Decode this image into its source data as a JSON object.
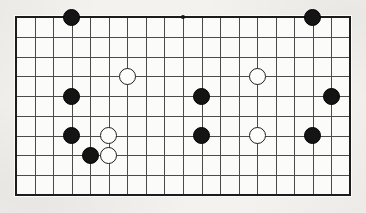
{
  "app": {
    "title": "Go Board Position",
    "caption": "Cropped view of a Go board showing a 19-column by 10-row section with black and white stones placed on line intersections."
  },
  "board": {
    "label": "go-board",
    "columns": 19,
    "rows": 10,
    "origin_x": 16,
    "origin_y": 17,
    "col_spacing": 18.55,
    "row_spacing": 19.78,
    "stone_diameter": 17,
    "hoshi_diameter": 4,
    "colors": {
      "board_surface": "#fbfbf9",
      "grid_line": "#4b4b4b",
      "edge_line": "#1c1c1c",
      "black_stone": "#141414",
      "white_stone": "#fdfdfc",
      "white_stone_outline": "#1e1e1e",
      "page_background": "#f3f2ef"
    },
    "star_points": [
      {
        "name": "hoshi-top",
        "col": 9,
        "row": 0
      }
    ],
    "stones": [
      {
        "name": "stone-black-c3-r0",
        "color": "black",
        "col": 3,
        "row": 0
      },
      {
        "name": "stone-black-c16-r0",
        "color": "black",
        "col": 16,
        "row": 0
      },
      {
        "name": "stone-white-c6-r3",
        "color": "white",
        "col": 6,
        "row": 3
      },
      {
        "name": "stone-white-c13-r3",
        "color": "white",
        "col": 13,
        "row": 3
      },
      {
        "name": "stone-black-c3-r4",
        "color": "black",
        "col": 3,
        "row": 4
      },
      {
        "name": "stone-black-c10-r4",
        "color": "black",
        "col": 10,
        "row": 4
      },
      {
        "name": "stone-black-c17-r4",
        "color": "black",
        "col": 17,
        "row": 4
      },
      {
        "name": "stone-black-c3-r6",
        "color": "black",
        "col": 3,
        "row": 6
      },
      {
        "name": "stone-white-c5-r6",
        "color": "white",
        "col": 5,
        "row": 6
      },
      {
        "name": "stone-black-c10-r6",
        "color": "black",
        "col": 10,
        "row": 6
      },
      {
        "name": "stone-white-c13-r6",
        "color": "white",
        "col": 13,
        "row": 6
      },
      {
        "name": "stone-black-c16-r6",
        "color": "black",
        "col": 16,
        "row": 6
      },
      {
        "name": "stone-black-c4-r7",
        "color": "black",
        "col": 4,
        "row": 7
      },
      {
        "name": "stone-white-c5-r7",
        "color": "white",
        "col": 5,
        "row": 7
      }
    ],
    "counts": {
      "black_stones": 9,
      "white_stones": 5,
      "total_stones": 14
    }
  }
}
